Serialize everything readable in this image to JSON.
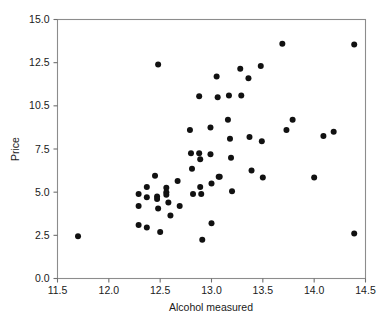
{
  "chart_data": {
    "type": "scatter",
    "title": "",
    "xlabel": "Alcohol measured",
    "ylabel": "Price",
    "xlim": [
      11.5,
      14.5
    ],
    "ylim": [
      0.0,
      15.0
    ],
    "xticks": [
      11.5,
      12.0,
      12.5,
      13.0,
      13.5,
      14.0,
      14.5
    ],
    "xticklabels": [
      "11.5",
      "12.0",
      "12.5",
      "13.0",
      "13.5",
      "14.0",
      "14.5"
    ],
    "yticks": [
      0.0,
      2.5,
      5.0,
      7.5,
      10.0,
      12.5,
      15.0
    ],
    "yticklabels": [
      "0.0",
      "2.5",
      "5.0",
      "7.5",
      "10.5",
      "12.5",
      "15.0"
    ],
    "grid": false,
    "legend": null,
    "marker": "filled-circle",
    "marker_color": "#111111",
    "marker_size": 3.0,
    "n_points": 65,
    "points": [
      {
        "x": 11.7,
        "y": 2.45
      },
      {
        "x": 12.29,
        "y": 4.9
      },
      {
        "x": 12.29,
        "y": 4.2
      },
      {
        "x": 12.29,
        "y": 3.1
      },
      {
        "x": 12.37,
        "y": 5.3
      },
      {
        "x": 12.37,
        "y": 4.7
      },
      {
        "x": 12.37,
        "y": 2.95
      },
      {
        "x": 12.45,
        "y": 5.95
      },
      {
        "x": 12.47,
        "y": 4.75
      },
      {
        "x": 12.47,
        "y": 4.6
      },
      {
        "x": 12.48,
        "y": 4.05
      },
      {
        "x": 12.48,
        "y": 12.4
      },
      {
        "x": 12.5,
        "y": 2.7
      },
      {
        "x": 12.56,
        "y": 5.25
      },
      {
        "x": 12.56,
        "y": 5.0
      },
      {
        "x": 12.56,
        "y": 4.85
      },
      {
        "x": 12.58,
        "y": 4.4
      },
      {
        "x": 12.6,
        "y": 3.65
      },
      {
        "x": 12.67,
        "y": 5.65
      },
      {
        "x": 12.69,
        "y": 4.2
      },
      {
        "x": 12.79,
        "y": 8.6
      },
      {
        "x": 12.8,
        "y": 7.25
      },
      {
        "x": 12.81,
        "y": 6.35
      },
      {
        "x": 12.82,
        "y": 4.9
      },
      {
        "x": 12.88,
        "y": 10.55
      },
      {
        "x": 12.88,
        "y": 7.25
      },
      {
        "x": 12.89,
        "y": 6.9
      },
      {
        "x": 12.89,
        "y": 5.3
      },
      {
        "x": 12.9,
        "y": 4.9
      },
      {
        "x": 12.91,
        "y": 2.25
      },
      {
        "x": 12.99,
        "y": 8.75
      },
      {
        "x": 12.99,
        "y": 7.2
      },
      {
        "x": 13.0,
        "y": 5.5
      },
      {
        "x": 13.0,
        "y": 3.2
      },
      {
        "x": 13.05,
        "y": 11.7
      },
      {
        "x": 13.06,
        "y": 10.5
      },
      {
        "x": 13.07,
        "y": 5.9
      },
      {
        "x": 13.08,
        "y": 5.9
      },
      {
        "x": 13.16,
        "y": 9.2
      },
      {
        "x": 13.17,
        "y": 10.6
      },
      {
        "x": 13.18,
        "y": 8.1
      },
      {
        "x": 13.19,
        "y": 7.0
      },
      {
        "x": 13.2,
        "y": 5.05
      },
      {
        "x": 13.28,
        "y": 12.15
      },
      {
        "x": 13.29,
        "y": 10.6
      },
      {
        "x": 13.36,
        "y": 11.6
      },
      {
        "x": 13.37,
        "y": 8.2
      },
      {
        "x": 13.39,
        "y": 6.25
      },
      {
        "x": 13.48,
        "y": 12.3
      },
      {
        "x": 13.49,
        "y": 7.95
      },
      {
        "x": 13.5,
        "y": 5.85
      },
      {
        "x": 13.69,
        "y": 13.6
      },
      {
        "x": 13.73,
        "y": 8.6
      },
      {
        "x": 13.79,
        "y": 9.2
      },
      {
        "x": 14.0,
        "y": 5.85
      },
      {
        "x": 14.09,
        "y": 8.25
      },
      {
        "x": 14.19,
        "y": 8.5
      },
      {
        "x": 14.39,
        "y": 13.55
      },
      {
        "x": 14.39,
        "y": 2.6
      }
    ]
  },
  "axes": {
    "xlabel": "Alcohol measured",
    "ylabel": "Price"
  }
}
